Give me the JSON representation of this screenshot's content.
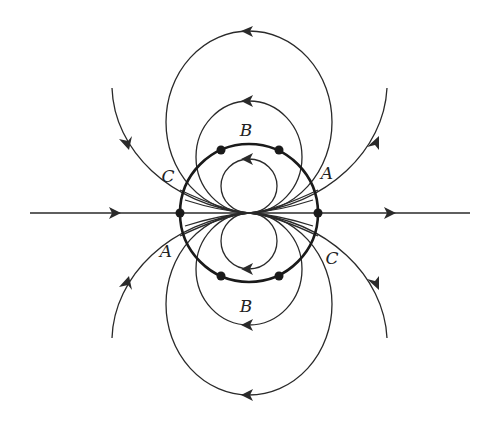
{
  "diagram": {
    "type": "flow-field-streamlines",
    "colors": {
      "background": "#ffffff",
      "stroke": "#2a2a2a",
      "boundary": "#1a1a1a"
    },
    "center": {
      "x": 249,
      "y": 213
    },
    "boundary_circle": {
      "cx": 249,
      "cy": 213,
      "r": 69
    },
    "stagnation_points": [
      {
        "x": 180,
        "y": 213
      },
      {
        "x": 318,
        "y": 213
      },
      {
        "x": 221,
        "y": 150
      },
      {
        "x": 279,
        "y": 150
      },
      {
        "x": 221,
        "y": 276
      },
      {
        "x": 279,
        "y": 276
      }
    ],
    "labels": [
      {
        "text": "B",
        "x": 246,
        "y": 130
      },
      {
        "text": "C",
        "x": 168,
        "y": 176
      },
      {
        "text": "A",
        "x": 327,
        "y": 173
      },
      {
        "text": "A",
        "x": 166,
        "y": 251
      },
      {
        "text": "C",
        "x": 332,
        "y": 258
      },
      {
        "text": "B",
        "x": 246,
        "y": 306
      }
    ]
  }
}
